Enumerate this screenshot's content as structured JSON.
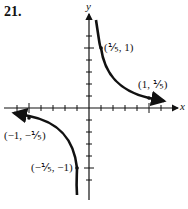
{
  "problem_number": "21.",
  "axes": {
    "x_label": "x",
    "y_label": "y"
  },
  "points": [
    {
      "label": "(1/5, 1)",
      "display": "(⅕, 1)"
    },
    {
      "label": "(1, 1/5)",
      "display": "(1, ⅕)"
    },
    {
      "label": "(-1, -1/5)",
      "display": "(−1, −⅕)"
    },
    {
      "label": "(-1/5, -1)",
      "display": "(−⅕, −1)"
    }
  ],
  "function": "y = 1/(5x)",
  "colors": {
    "ink": "#111111",
    "background": "#ffffff"
  }
}
